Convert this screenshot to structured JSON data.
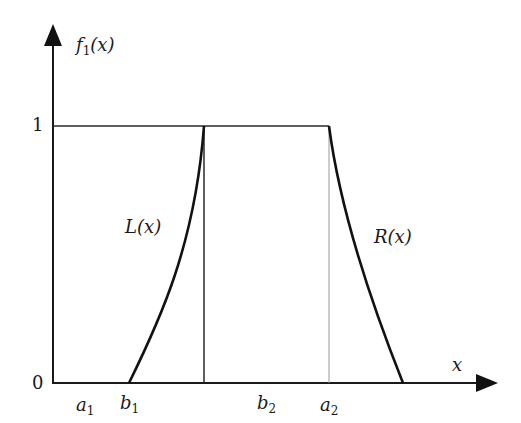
{
  "diagram": {
    "type": "trapezoidal membership function (LR fuzzy number)",
    "y_axis": {
      "label_main": "f",
      "label_sub": "1",
      "label_arg": "(x)"
    },
    "x_axis": {
      "label": "x"
    },
    "y_ticks": [
      {
        "label": "0",
        "value": 0
      },
      {
        "label": "1",
        "value": 1
      }
    ],
    "x_ticks": [
      {
        "main": "a",
        "sub": "1"
      },
      {
        "main": "b",
        "sub": "1"
      },
      {
        "main": "b",
        "sub": "2"
      },
      {
        "main": "a",
        "sub": "2"
      }
    ],
    "curve_labels": {
      "left": "L(x)",
      "right": "R(x)"
    },
    "colors": {
      "axis": "#1a1a1a",
      "curve": "#111111",
      "guide_dark": "#2a2a2a",
      "guide_light": "#9a9a9a",
      "background": "#ffffff"
    }
  }
}
